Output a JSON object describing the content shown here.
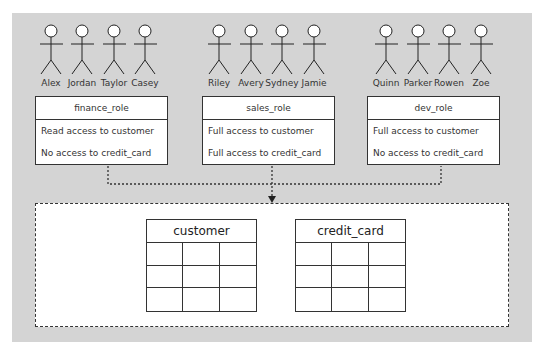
{
  "colors": {
    "panel_bg": "#d4d4d4",
    "box_bg": "#ffffff",
    "line": "#333333"
  },
  "roles": [
    {
      "name": "finance_role",
      "users": [
        "Alex",
        "Jordan",
        "Taylor",
        "Casey"
      ],
      "permissions": [
        "Read access to customer",
        "No access to credit_card"
      ]
    },
    {
      "name": "sales_role",
      "users": [
        "Riley",
        "Avery",
        "Sydney",
        "Jamie"
      ],
      "permissions": [
        "Full access to customer",
        "Full access to credit_card"
      ]
    },
    {
      "name": "dev_role",
      "users": [
        "Quinn",
        "Parker",
        "Rowen",
        "Zoe"
      ],
      "permissions": [
        "Full access to customer",
        "No access to credit_card"
      ]
    }
  ],
  "database": {
    "tables": [
      {
        "name": "customer",
        "rows": 3,
        "columns": 3
      },
      {
        "name": "credit_card",
        "rows": 3,
        "columns": 3
      }
    ]
  }
}
